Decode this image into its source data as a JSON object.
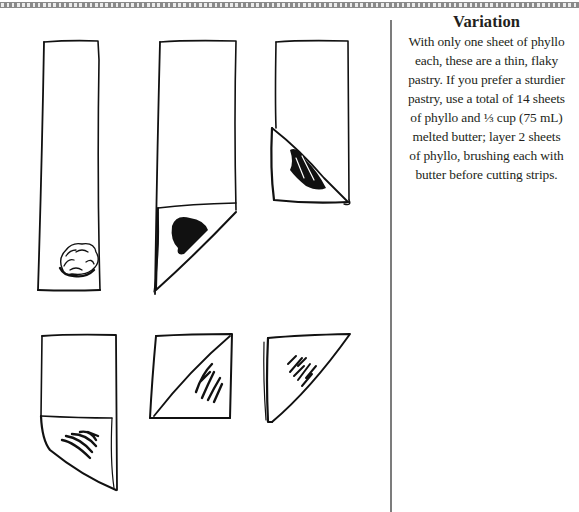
{
  "page": {
    "background": "#ffffff",
    "rule_color": "#8a8a8a",
    "divider_color": "#7c7c7c",
    "text_color": "#231f20"
  },
  "sidebar": {
    "heading": "Variation",
    "lines": [
      "With only one sheet of phyllo",
      "each, these are a thin, flaky",
      "pastry. If you prefer a sturdier",
      "pastry, use a total of 14 sheets",
      "of phyllo and ⅓ cup (75 mL)",
      "melted butter; layer 2 sheets",
      "of phyllo, brushing each with",
      "butter before cutting strips."
    ]
  },
  "illustrations": {
    "description": "Six-step line drawing of folding a phyllo strip into a triangle around a filling",
    "steps": [
      {
        "step": 1,
        "label": "phyllo strip with filling mound at bottom"
      },
      {
        "step": 2,
        "label": "bottom corner folded up diagonally over filling"
      },
      {
        "step": 3,
        "label": "triangle folded upward along strip"
      },
      {
        "step": 4,
        "label": "strip folded again, triangle at bottom"
      },
      {
        "step": 5,
        "label": "nearly square folded packet"
      },
      {
        "step": 6,
        "label": "finished triangle pastry"
      }
    ]
  }
}
